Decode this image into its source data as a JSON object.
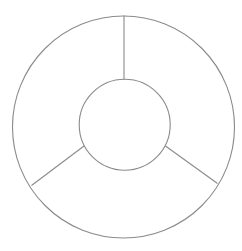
{
  "diagram": {
    "type": "ring-diagram",
    "segments": 3,
    "labels": [],
    "colors": {
      "background": "#ffffff",
      "stroke": "#8a8a8a"
    },
    "outer_circle": {
      "cx": 123.5,
      "cy": 127,
      "r": 111
    },
    "inner_circle": {
      "cx": 124.7,
      "cy": 124.7,
      "r": 45.5
    },
    "dividers": [
      {
        "name": "top",
        "x1": 124,
        "y1": 79.5,
        "x2": 124,
        "y2": 15.5
      },
      {
        "name": "lower-left",
        "x1": 84,
        "y1": 146,
        "x2": 31.5,
        "y2": 185.5
      },
      {
        "name": "lower-right",
        "x1": 165.5,
        "y1": 146,
        "x2": 217.5,
        "y2": 183.5
      }
    ]
  }
}
